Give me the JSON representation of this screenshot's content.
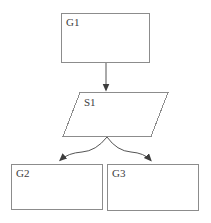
{
  "diagram": {
    "type": "flowchart",
    "colors": {
      "background": "#ffffff",
      "box_stroke": "#8c8c8c",
      "edge_stroke": "#555555",
      "arrowhead_fill": "#3d3d3d",
      "label_text": "#404040",
      "shape_fill": "#ffffff"
    },
    "nodes": {
      "g1": {
        "label": "G1",
        "shape": "rectangle"
      },
      "s1": {
        "label": "S1",
        "shape": "parallelogram"
      },
      "g2": {
        "label": "G2",
        "shape": "rectangle"
      },
      "g3": {
        "label": "G3",
        "shape": "rectangle"
      }
    },
    "edges": [
      {
        "from": "G1",
        "to": "S1",
        "type": "straight-arrow"
      },
      {
        "from": "S1",
        "to": "G2",
        "type": "curved-arrow"
      },
      {
        "from": "S1",
        "to": "G3",
        "type": "curved-arrow"
      }
    ]
  }
}
